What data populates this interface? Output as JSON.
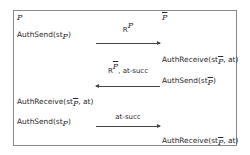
{
  "parties": {
    "left": "P",
    "right": "P"
  },
  "rows": [
    {
      "left": "AuthSend(st",
      "left_sub": "P",
      "left_sub_over": false,
      "left_tail": ")"
    },
    {
      "right": "AuthReceive(st",
      "right_sub": "P",
      "right_sub_over": true,
      "right_tail": ", at)"
    },
    {
      "right": "AuthSend(st",
      "right_sub": "P",
      "right_sub_over": true,
      "right_tail": ")"
    },
    {
      "left": "AuthReceive(st",
      "left_sub": "P",
      "left_sub_over": true,
      "left_tail": ", at)"
    },
    {
      "left": "AuthSend(st",
      "left_sub": "P",
      "left_sub_over": false,
      "left_tail": ")"
    },
    {
      "right": "AuthReceive(st",
      "right_sub": "P",
      "right_sub_over": true,
      "right_tail": ", at)"
    }
  ],
  "messages": [
    {
      "label_base": "R",
      "label_sup": "P",
      "label_sup_over": false,
      "label_tail": "",
      "direction": "right"
    },
    {
      "label_base": "R",
      "label_sup": "P",
      "label_sup_over": true,
      "label_tail": ", at-succ",
      "direction": "left"
    },
    {
      "label_base": "",
      "label_sup": "",
      "label_sup_over": false,
      "label_tail": "at-succ",
      "direction": "right"
    }
  ]
}
